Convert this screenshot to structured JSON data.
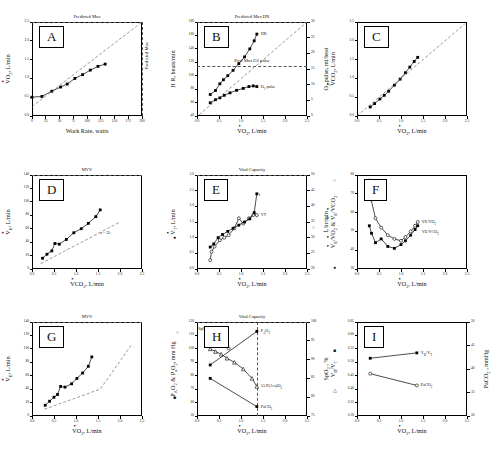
{
  "figure": {
    "panels_order": [
      "A",
      "B",
      "C",
      "D",
      "E",
      "F",
      "G",
      "H",
      "I"
    ]
  },
  "axis_titles": {
    "vo2": "VO2, L/min",
    "vco2": "VCO2, L/min",
    "ve": "VE, L/min",
    "vt": "VT, L/min",
    "work_rate": "Work Rate, watts",
    "hr": "H R, beats/min",
    "o2_pulse": "O2 pulse, ml/beat",
    "freq": "f, br/min",
    "ve_ratios": "VE/VO2 & VE/VCO2",
    "pao2_pao2": "PAO2 & PaO2",
    "mmhg": ", mm Hg",
    "spo2": "SpO2 , %",
    "vdvt": "VD/VT",
    "paco2": "PaCO2 , mmHg"
  },
  "chart_data": [
    {
      "id": "A",
      "type": "line",
      "letter": "A",
      "title": "",
      "top_annotation": "Predicted Max",
      "right_annotation": "Predicted Max",
      "xlabel": "Work Rate, watts",
      "ylabel": "VO2, L/min",
      "xlim": [
        0,
        200
      ],
      "ylim": [
        0.0,
        2.5
      ],
      "xticks": [
        0,
        25,
        50,
        75,
        100,
        125,
        150,
        175,
        200
      ],
      "yticks": [
        "0.0",
        "0.5",
        "1.0",
        "1.5",
        "2.0",
        "2.5"
      ],
      "series": [
        {
          "name": "VO2 response",
          "marker": "filled-square",
          "x": [
            0,
            18,
            36,
            52,
            64,
            78,
            92,
            106,
            120,
            133
          ],
          "y": [
            0.5,
            0.52,
            0.66,
            0.77,
            0.85,
            1.0,
            1.1,
            1.22,
            1.32,
            1.38
          ]
        },
        {
          "name": "predicted slope (10 ml/min/W)",
          "style": "dashed",
          "x": [
            0,
            200
          ],
          "y": [
            0.25,
            2.5
          ]
        }
      ],
      "reference_lines": [
        {
          "kind": "horizontal",
          "label": "Predicted Max",
          "y": 2.5
        },
        {
          "kind": "vertical",
          "label": "Predicted Max",
          "x": 200
        }
      ]
    },
    {
      "id": "B",
      "type": "line",
      "letter": "B",
      "top_annotation": "Predicted Max HR",
      "xlabel": "VO2, L/min",
      "ylabel": "H R, beats/min",
      "ylabel_right": "O2 pulse, ml/beat",
      "xlim": [
        0.0,
        2.5
      ],
      "ylim": [
        40,
        180
      ],
      "ylim_right": [
        0,
        30
      ],
      "xticks": [
        "0.0",
        "0.5",
        "1.0",
        "1.5",
        "2.0",
        "2.5"
      ],
      "yticks": [
        40,
        60,
        80,
        100,
        120,
        140,
        160,
        180
      ],
      "yticks_right": [
        0,
        5,
        10,
        15,
        20,
        25,
        30
      ],
      "series": [
        {
          "name": "HR",
          "label": "HR",
          "marker": "filled-square",
          "x": [
            0.3,
            0.42,
            0.52,
            0.6,
            0.7,
            0.82,
            0.95,
            1.08,
            1.2,
            1.3,
            1.36
          ],
          "y": [
            72,
            78,
            88,
            94,
            100,
            108,
            118,
            128,
            140,
            152,
            162
          ]
        },
        {
          "name": "O2 pulse",
          "label": "O2 pulse",
          "marker": "filled-square",
          "x": [
            0.3,
            0.42,
            0.52,
            0.62,
            0.75,
            0.9,
            1.05,
            1.18,
            1.28,
            1.36
          ],
          "y_right": [
            4.2,
            5.2,
            5.8,
            6.6,
            7.4,
            8.2,
            8.8,
            9.4,
            9.6,
            9.4
          ]
        },
        {
          "name": "identity/predicted dashed",
          "style": "dashed",
          "x": [
            0.05,
            2.5
          ],
          "y": [
            42,
            180
          ]
        }
      ],
      "reference_lines": [
        {
          "kind": "horizontal",
          "label": "Predicted Max HR",
          "y": 180
        },
        {
          "kind": "horizontal",
          "label": "Pred Max O2 pulse",
          "y": 115
        }
      ]
    },
    {
      "id": "C",
      "type": "line",
      "letter": "C",
      "xlabel": "VO2, L/min",
      "ylabel": "VCO2, L/min",
      "xlim": [
        0.0,
        2.5
      ],
      "ylim": [
        0.0,
        2.5
      ],
      "xticks": [
        "0.0",
        "0.5",
        "1.0",
        "1.5",
        "2.0",
        "2.5"
      ],
      "yticks": [
        "0.0",
        "0.5",
        "1.0",
        "1.5",
        "2.0",
        "2.5"
      ],
      "series": [
        {
          "name": "VCO2 vs VO2",
          "marker": "filled-square",
          "x": [
            0.3,
            0.4,
            0.52,
            0.62,
            0.72,
            0.85,
            0.98,
            1.1,
            1.2,
            1.3,
            1.38
          ],
          "y": [
            0.24,
            0.33,
            0.45,
            0.55,
            0.66,
            0.82,
            0.98,
            1.15,
            1.3,
            1.45,
            1.56
          ]
        },
        {
          "name": "identity line (RER = 1)",
          "style": "dashed",
          "x": [
            0.0,
            2.45
          ],
          "y": [
            0.0,
            2.45
          ]
        }
      ]
    },
    {
      "id": "D",
      "type": "line",
      "letter": "D",
      "top_annotation": "MVV",
      "xlabel": "VCO2, L/min",
      "ylabel": "VE, L/min",
      "annotation": "s = 35",
      "xlim": [
        0.0,
        2.5
      ],
      "ylim": [
        0,
        140
      ],
      "xticks": [
        "0.0",
        "0.5",
        "1.0",
        "1.5",
        "2.0",
        "2.5"
      ],
      "yticks": [
        0,
        20,
        40,
        60,
        80,
        100,
        120,
        140
      ],
      "series": [
        {
          "name": "VE vs VCO2",
          "marker": "filled-square",
          "x": [
            0.24,
            0.34,
            0.45,
            0.52,
            0.62,
            0.78,
            0.95,
            1.12,
            1.28,
            1.45,
            1.55
          ],
          "y": [
            16,
            22,
            27,
            38,
            37,
            44,
            54,
            60,
            68,
            78,
            88
          ]
        },
        {
          "name": "slope 35 reference",
          "style": "dashed",
          "x": [
            0.2,
            2.0
          ],
          "y": [
            8,
            70
          ]
        }
      ],
      "reference_lines": [
        {
          "kind": "horizontal",
          "label": "MVV",
          "y": 140
        }
      ]
    },
    {
      "id": "E",
      "type": "line",
      "letter": "E",
      "top_annotation": "Vital Capacity",
      "xlabel": "VO2, L/min",
      "ylabel": "VT, L/min",
      "ylabel_right": "f, br/min",
      "xlim": [
        0.0,
        2.5
      ],
      "ylim": [
        0.0,
        3.0
      ],
      "ylim_right": [
        20,
        50
      ],
      "xticks": [
        "0.0",
        "0.5",
        "1.0",
        "1.5",
        "2.0",
        "2.5"
      ],
      "yticks": [
        "0.0",
        "0.5",
        "1.0",
        "1.5",
        "2.0",
        "2.5",
        "3.0"
      ],
      "yticks_right": [
        20,
        25,
        30,
        35,
        40,
        45,
        50
      ],
      "series": [
        {
          "name": "VT",
          "label": "VT",
          "marker": "open-circle",
          "x": [
            0.3,
            0.33,
            0.4,
            0.52,
            0.62,
            0.72,
            0.85,
            0.95,
            1.05,
            1.18,
            1.28,
            1.36
          ],
          "y": [
            0.28,
            0.55,
            0.72,
            0.92,
            1.0,
            1.08,
            1.3,
            1.62,
            1.45,
            1.62,
            1.72,
            1.72
          ]
        },
        {
          "name": "f",
          "label": "f",
          "marker": "filled-square",
          "x": [
            0.3,
            0.38,
            0.48,
            0.58,
            0.7,
            0.82,
            0.95,
            1.08,
            1.2,
            1.3,
            1.36
          ],
          "y_right": [
            27,
            28,
            30,
            31,
            32,
            33,
            34,
            35,
            36,
            38,
            44
          ]
        }
      ],
      "reference_lines": [
        {
          "kind": "horizontal",
          "label": "Vital Capacity",
          "y": 3.0
        }
      ]
    },
    {
      "id": "F",
      "type": "line",
      "letter": "F",
      "xlabel": "VO2, L/min",
      "ylabel": "VE/VO2 & VE/VCO2",
      "xlim": [
        0.0,
        2.5
      ],
      "ylim": [
        30,
        80
      ],
      "xticks": [
        "0.0",
        "0.5",
        "1.0",
        "1.5",
        "2.0",
        "2.5"
      ],
      "yticks": [
        30,
        40,
        50,
        60,
        70,
        80
      ],
      "series": [
        {
          "name": "VE/VO2",
          "label": "VE/VO2",
          "marker": "open-circle",
          "x": [
            0.28,
            0.32,
            0.42,
            0.55,
            0.7,
            0.85,
            1.0,
            1.1,
            1.22,
            1.32,
            1.38
          ],
          "y": [
            77,
            67,
            57,
            52,
            48,
            46,
            45,
            47,
            50,
            53,
            55
          ]
        },
        {
          "name": "VE/VCO2",
          "label": "VE/VCO2",
          "marker": "filled-square",
          "x": [
            0.28,
            0.33,
            0.42,
            0.55,
            0.7,
            0.85,
            1.0,
            1.1,
            1.22,
            1.32,
            1.38
          ],
          "y": [
            53,
            49,
            44,
            46,
            42,
            41,
            43,
            45,
            48,
            51,
            53
          ]
        }
      ]
    },
    {
      "id": "G",
      "type": "line",
      "letter": "G",
      "top_annotation": "MVV",
      "xlabel": "VO2, L/min",
      "ylabel": "VE, L/min",
      "xlim": [
        0.0,
        2.5
      ],
      "ylim": [
        0,
        140
      ],
      "xticks": [
        "0.0",
        "0.5",
        "1.0",
        "1.5",
        "2.0",
        "2.5"
      ],
      "yticks": [
        0,
        20,
        40,
        60,
        80,
        100,
        120,
        140
      ],
      "series": [
        {
          "name": "VE vs VO2",
          "marker": "filled-square",
          "x": [
            0.3,
            0.4,
            0.5,
            0.58,
            0.65,
            0.75,
            0.9,
            1.02,
            1.15,
            1.28,
            1.36
          ],
          "y": [
            16,
            22,
            28,
            32,
            44,
            43,
            48,
            56,
            64,
            74,
            88
          ]
        },
        {
          "name": "normal reference",
          "style": "dashed",
          "x": [
            0.28,
            1.55,
            2.25
          ],
          "y": [
            10,
            40,
            105
          ]
        }
      ],
      "reference_lines": [
        {
          "kind": "horizontal",
          "label": "MVV",
          "y": 140
        }
      ]
    },
    {
      "id": "H",
      "type": "line",
      "letter": "H",
      "top_annotation": "Vital Capacity",
      "xlabel": "VO2, L/min",
      "ylabel": "PAO2 & PaO2 , mm Hg",
      "ylabel_right": "SpO2 , %",
      "xlim": [
        0.0,
        2.5
      ],
      "ylim": [
        50,
        120
      ],
      "ylim_right": [
        75,
        100
      ],
      "xticks": [
        "0.0",
        "0.5",
        "1.0",
        "1.5",
        "2.0",
        "2.5"
      ],
      "yticks": [
        50,
        60,
        70,
        80,
        90,
        100,
        110,
        120
      ],
      "yticks_right": [
        75,
        80,
        85,
        90,
        95,
        100
      ],
      "annotations": [
        {
          "text": "SpO2",
          "kind": "series-label"
        },
        {
          "text": "PAO2",
          "kind": "series-label"
        },
        {
          "text": "55 P(A-a)O2",
          "kind": "series-label"
        },
        {
          "text": "PaO2",
          "kind": "series-label"
        },
        {
          "text": "PaCO2",
          "kind": "series-label"
        }
      ],
      "series": [
        {
          "name": "PAO2",
          "label": "PAO2",
          "marker": "filled-square",
          "x": [
            0.3,
            1.36
          ],
          "y": [
            88,
            113
          ]
        },
        {
          "name": "PaO2 / P(A-a)O2",
          "label": "55 P(A-a)O2",
          "marker": "open-triangle",
          "x": [
            0.3,
            0.42,
            0.55,
            0.68,
            0.85,
            1.05,
            1.25,
            1.36
          ],
          "y": [
            100,
            98,
            96,
            93,
            90,
            85,
            78,
            72
          ]
        },
        {
          "name": "PaCO2 line",
          "label": "PaCO2",
          "marker": "filled-square",
          "x": [
            0.3,
            1.36
          ],
          "y": [
            78,
            57
          ]
        },
        {
          "name": "SpO2",
          "label": "SpO2",
          "marker": "open-circle",
          "x": [
            0.3,
            0.4,
            0.5,
            0.62,
            0.72
          ],
          "y_right": [
            97,
            96,
            95,
            94,
            93
          ]
        }
      ],
      "reference_lines": [
        {
          "kind": "horizontal",
          "label": "Vital Capacity",
          "y": 120
        },
        {
          "kind": "vertical",
          "x": 1.36
        }
      ]
    },
    {
      "id": "I",
      "type": "line",
      "letter": "I",
      "xlabel": "VO2, L/min",
      "ylabel": "VD/VT",
      "ylabel_right": "PaCO2 , mmHg",
      "xlim": [
        0.0,
        2.5
      ],
      "ylim": [
        0.3,
        0.65
      ],
      "ylim_right": [
        30,
        50
      ],
      "xticks": [
        "0.0",
        "0.5",
        "1.0",
        "1.5",
        "2.0",
        "2.5"
      ],
      "yticks": [
        "0.30",
        "0.35",
        "0.40",
        "0.45",
        "0.50",
        "0.55",
        "0.60",
        "0.65"
      ],
      "yticks_right": [
        30,
        35,
        40,
        45,
        50
      ],
      "series": [
        {
          "name": "VD/VT",
          "label": "VD/VT",
          "marker": "filled-square",
          "x": [
            0.3,
            1.36
          ],
          "y": [
            0.515,
            0.535
          ]
        },
        {
          "name": "PaCO2",
          "label": "PaCO2",
          "marker": "open-circle",
          "x": [
            0.3,
            1.36
          ],
          "y_right": [
            39.0,
            36.5
          ]
        }
      ]
    }
  ],
  "legend_markers": {
    "filled_square": "■",
    "open_circle": "○",
    "open_triangle": "△",
    "filled_circle": "●"
  }
}
